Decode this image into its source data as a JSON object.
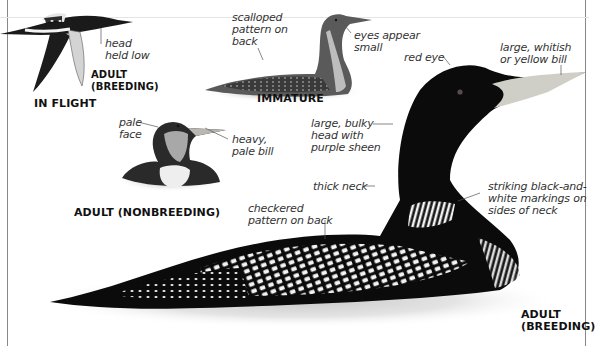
{
  "figures": {
    "in_flight": {
      "caption": "IN FLIGHT",
      "sub_caption": "ADULT\n(BREEDING)",
      "labels": [
        "head\nheld low"
      ]
    },
    "immature": {
      "caption": "IMMATURE",
      "labels": [
        "scalloped\npattern on\nback",
        "eyes appear\nsmall"
      ]
    },
    "adult_nonbreeding": {
      "caption": "ADULT (NONBREEDING)",
      "labels": [
        "pale\nface",
        "heavy,\npale bill"
      ]
    },
    "adult_breeding": {
      "caption": "ADULT\n(BREEDING)",
      "labels": [
        "red eye",
        "large, whitish\nor yellow bill",
        "large, bulky\nhead with\npurple sheen",
        "thick neck",
        "striking black-and-\nwhite markings on\nsides of neck",
        "checkered\npattern on back"
      ]
    }
  },
  "colors": {
    "plumage_dark": "#0b0b0b",
    "bill": "#cfcfc8",
    "water": "#d9d9d9",
    "leader": "#555555",
    "frame": "#888888"
  }
}
